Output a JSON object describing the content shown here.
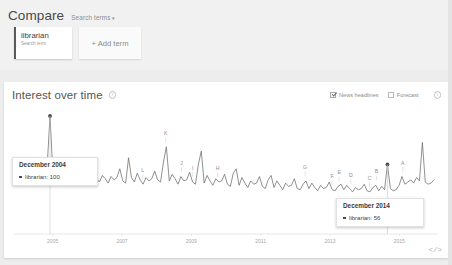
{
  "compare": {
    "title": "Compare",
    "dropdown_label": "Search terms",
    "dropdown_caret": "▾",
    "terms": [
      {
        "name": "librarian",
        "subtitle": "Search term"
      }
    ],
    "add_term_label": "+ Add term"
  },
  "interest_over_time": {
    "title": "Interest over time",
    "info_glyph": "i",
    "controls": [
      {
        "label": "News headlines",
        "checked": true
      },
      {
        "label": "Forecast",
        "checked": false
      }
    ],
    "help_glyph": "i"
  },
  "tooltips": [
    {
      "date": "December 2004",
      "series_label": "librarian",
      "value": "100",
      "text": "librarian: 100"
    },
    {
      "date": "December 2014",
      "series_label": "librarian",
      "value": "56",
      "text": "librarian: 56"
    }
  ],
  "embed": {
    "label": "</>"
  },
  "colors": {
    "page_background": "#ededed",
    "panel_background": "#ffffff",
    "line": "#5a5a5a",
    "card_accent": "#5a5a5a",
    "text_primary": "#4a4a4a",
    "text_muted": "#8d8d8d"
  },
  "chart_data": {
    "type": "line",
    "title": "Interest over time",
    "xlabel": "",
    "ylabel": "",
    "ylim": [
      0,
      100
    ],
    "grid": false,
    "legend_position": "none",
    "series": [
      {
        "name": "librarian",
        "values": [
          52,
          50,
          56,
          54,
          48,
          58,
          55,
          46,
          52,
          49,
          53,
          100,
          48,
          45,
          52,
          47,
          44,
          50,
          46,
          42,
          48,
          45,
          47,
          58,
          44,
          41,
          47,
          43,
          40,
          46,
          43,
          39,
          45,
          42,
          44,
          52,
          41,
          39,
          62,
          44,
          40,
          48,
          42,
          38,
          44,
          41,
          43,
          50,
          42,
          40,
          58,
          72,
          41,
          47,
          43,
          38,
          45,
          41,
          42,
          49,
          40,
          38,
          56,
          68,
          39,
          46,
          41,
          37,
          43,
          40,
          41,
          47,
          38,
          36,
          48,
          52,
          37,
          44,
          39,
          35,
          41,
          38,
          39,
          45,
          36,
          34,
          42,
          46,
          35,
          41,
          37,
          33,
          39,
          36,
          37,
          43,
          34,
          33,
          38,
          41,
          34,
          39,
          35,
          32,
          37,
          34,
          35,
          40,
          33,
          32,
          36,
          38,
          33,
          37,
          34,
          31,
          35,
          33,
          34,
          38,
          32,
          31,
          35,
          37,
          32,
          36,
          33,
          56,
          34,
          32,
          33,
          37,
          45,
          38,
          40,
          42,
          39,
          44,
          41,
          76,
          40,
          38,
          39,
          42
        ]
      }
    ],
    "x_tick_labels": [
      "2005",
      "2007",
      "2009",
      "2011",
      "2013",
      "2015"
    ],
    "annotations": [
      {
        "marker": "A",
        "approx_x_fraction": 0.925
      },
      {
        "marker": "B",
        "approx_x_fraction": 0.862
      },
      {
        "marker": "C",
        "approx_x_fraction": 0.845
      },
      {
        "marker": "D",
        "approx_x_fraction": 0.8
      },
      {
        "marker": "E",
        "approx_x_fraction": 0.772
      },
      {
        "marker": "F",
        "approx_x_fraction": 0.755
      },
      {
        "marker": "G",
        "approx_x_fraction": 0.69
      },
      {
        "marker": "H",
        "approx_x_fraction": 0.48
      },
      {
        "marker": "I",
        "approx_x_fraction": 0.42
      },
      {
        "marker": "J",
        "approx_x_fraction": 0.393
      },
      {
        "marker": "K",
        "approx_x_fraction": 0.355
      },
      {
        "marker": "L",
        "approx_x_fraction": 0.3
      }
    ],
    "highlight_points": [
      {
        "label": "December 2004",
        "value": 100
      },
      {
        "label": "December 2014",
        "value": 56
      }
    ]
  }
}
